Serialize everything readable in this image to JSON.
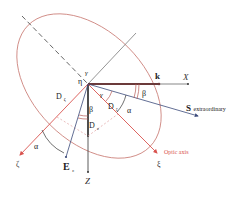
{
  "figure": {
    "colors": {
      "axis": "#333333",
      "red": "#d9534f",
      "ellipse": "#c97a72",
      "blue": "#3b4a7a",
      "gray": "#7a7a7a",
      "dashed_pink": "#e0a0a0",
      "optic_label": "#d9534f"
    },
    "labels": {
      "x_axis": "X",
      "z_axis": "Z",
      "k_vector": "k",
      "s_vector": "S",
      "s_vector_suffix": "extraordinary",
      "e_vector": "E",
      "e_subscript": "ε",
      "zeta_axis": "ζ",
      "xi_axis": "ξ",
      "optic_axis": "Optic axis",
      "eta": "η",
      "gamma_top": "γ",
      "gamma_inner": "γ",
      "beta_right": "β",
      "beta_lower": "β",
      "alpha_right": "α",
      "alpha_left": "α",
      "d_zeta": "D",
      "d_zeta_sub": "ζ",
      "d_xi": "D",
      "d_xi_sub": "ξ",
      "d_z": "D",
      "d_z_sub": "z"
    }
  }
}
